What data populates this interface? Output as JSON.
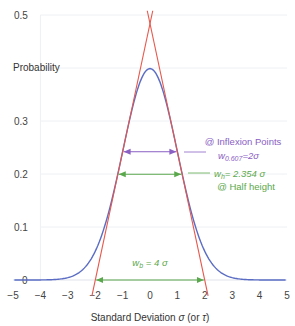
{
  "chart_data": {
    "type": "line",
    "title": "",
    "xlabel": "Standard Deviation σ (or τ)",
    "ylabel": "Probability",
    "xlim": [
      -5,
      5
    ],
    "ylim": [
      0,
      0.5
    ],
    "x_ticks": [
      -5,
      -4,
      -3,
      -2,
      -1,
      0,
      1,
      2,
      3,
      4,
      5
    ],
    "x_tick_labels": [
      "−5",
      "−4",
      "−3",
      "−2",
      "−1",
      "0",
      "1",
      "2",
      "3",
      "4",
      "5"
    ],
    "y_ticks": [
      0,
      0.1,
      0.2,
      0.3,
      0.5
    ],
    "y_tick_labels": [
      "0",
      "0.1",
      "0.2",
      "0.3",
      "0.5"
    ],
    "grid": true,
    "legend": null,
    "series": [
      {
        "name": "Gaussian (normal) distribution",
        "color": "#5a6cc4",
        "x": [
          -5,
          -4.5,
          -4,
          -3.5,
          -3,
          -2.5,
          -2,
          -1.5,
          -1,
          -0.5,
          0,
          0.5,
          1,
          1.5,
          2,
          2.5,
          3,
          3.5,
          4,
          4.5,
          5
        ],
        "values": [
          0.0,
          0.0,
          0.0001,
          0.0009,
          0.0044,
          0.0175,
          0.054,
          0.1295,
          0.242,
          0.3521,
          0.3989,
          0.3521,
          0.242,
          0.1295,
          0.054,
          0.0175,
          0.0044,
          0.0009,
          0.0001,
          0.0,
          0.0
        ]
      },
      {
        "name": "Left inflection tangent",
        "color": "#e8564a",
        "x": [
          -2.12,
          0.1
        ],
        "values": [
          -0.03,
          0.508
        ]
      },
      {
        "name": "Right inflection tangent",
        "color": "#e8564a",
        "x": [
          -0.1,
          2.12
        ],
        "values": [
          0.508,
          -0.03
        ]
      }
    ],
    "annotations": [
      {
        "text": "@ Inflexion Points",
        "color": "#8a60c4",
        "width_at_y": 0.242,
        "from_x": -1,
        "to_x": 1
      },
      {
        "text": "w0.607 = 2σ",
        "color": "#8a60c4"
      },
      {
        "text": "wh = 2.354σ",
        "color": "#5aa84c",
        "width_at_y": 0.1995,
        "from_x": -1.177,
        "to_x": 1.177
      },
      {
        "text": "@ Half height",
        "color": "#5aa84c"
      },
      {
        "text": "wb = 4σ",
        "color": "#5aa84c",
        "width_at_y": 0,
        "from_x": -2,
        "to_x": 2
      }
    ]
  },
  "labels": {
    "y_axis_title": "Probability",
    "x_axis_title_pre": "Standard Deviation ",
    "x_axis_sigma": "σ",
    "x_axis_mid": " (or ",
    "x_axis_tau": "τ",
    "x_axis_post": ")",
    "inflexion_title": "@ Inflexion Points",
    "w0607_w": "w",
    "w0607_sub": "0.607",
    "w0607_eq": "=2σ",
    "wh_w": "w",
    "wh_sub": "h",
    "wh_eq": "= 2.354 σ",
    "half_height": "@ Half height",
    "wb_w": "w",
    "wb_sub": "b",
    "wb_eq": " = 4 σ"
  },
  "colors": {
    "curve": "#5a6cc4",
    "tangent": "#e8564a",
    "inflexion": "#8a60c4",
    "half": "#5aa84c",
    "grid": "#eef0f4"
  }
}
